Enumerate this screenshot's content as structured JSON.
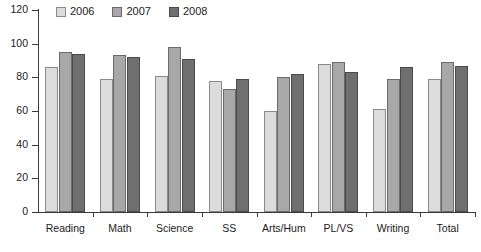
{
  "chart_data": {
    "type": "bar",
    "title": "",
    "xlabel": "",
    "ylabel": "",
    "ylim": [
      0,
      120
    ],
    "yticks": [
      0,
      20,
      40,
      60,
      80,
      100,
      120
    ],
    "grid": false,
    "legend_position": "top-left",
    "categories": [
      "Reading",
      "Math",
      "Science",
      "SS",
      "Arts/Hum",
      "PL/VS",
      "Writing",
      "Total"
    ],
    "series": [
      {
        "name": "2006",
        "color": "#dcdcdc",
        "values": [
          86,
          79,
          81,
          78,
          60,
          88,
          61,
          79
        ]
      },
      {
        "name": "2007",
        "color": "#a8a8a8",
        "values": [
          95,
          93,
          98,
          73,
          80,
          89,
          79,
          89
        ]
      },
      {
        "name": "2008",
        "color": "#6f6f6f",
        "values": [
          94,
          92,
          91,
          79,
          82,
          83,
          86,
          87
        ]
      }
    ]
  },
  "legend": {
    "items": [
      {
        "label": "2006"
      },
      {
        "label": "2007"
      },
      {
        "label": "2008"
      }
    ]
  },
  "axis": {
    "y_tick_labels": [
      "120",
      "100",
      "80",
      "60",
      "40",
      "20",
      "0"
    ]
  }
}
